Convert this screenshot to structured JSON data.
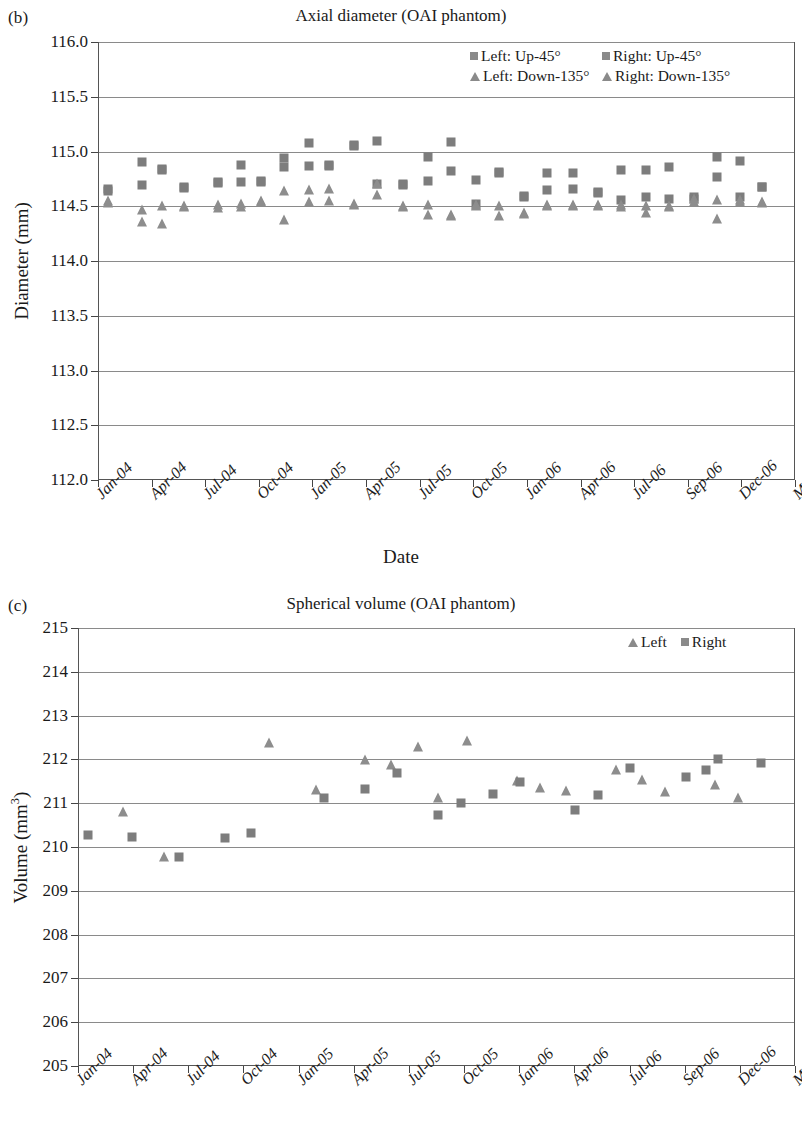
{
  "figure": {
    "panels": [
      {
        "id": "b",
        "panel_label": "(b)",
        "title": "Axial diameter (OAI phantom)"
      },
      {
        "id": "c",
        "panel_label": "(c)",
        "title": "Spherical volume (OAI phantom)"
      }
    ]
  },
  "chart_data": [
    {
      "type": "scatter",
      "panel": "(b)",
      "title": "Axial diameter (OAI phantom)",
      "xlabel": "Date",
      "ylabel": "Diameter (mm)",
      "ylim": [
        112.0,
        116.0
      ],
      "ytick_labels": [
        "116.0",
        "115.5",
        "115.0",
        "114.5",
        "114.0",
        "113.5",
        "113.0",
        "112.5",
        "112.0"
      ],
      "yticks": [
        116.0,
        115.5,
        115.0,
        114.5,
        114.0,
        113.5,
        113.0,
        112.5,
        112.0
      ],
      "xtick_labels": [
        "Jan-04",
        "Apr-04",
        "Jul-04",
        "Oct-04",
        "Jan-05",
        "Apr-05",
        "Jul-05",
        "Oct-05",
        "Jan-06",
        "Apr-06",
        "Jul-06",
        "Sep-06",
        "Dec-06",
        "Mar-07"
      ],
      "grid": true,
      "legend_position": "top-right",
      "legend": [
        "Left: Up-45°",
        "Right: Up-45°",
        "Left: Down-135°",
        "Right: Down-135°"
      ],
      "series": [
        {
          "name": "Left: Up-45°",
          "marker": "square",
          "color": "#7d7d7d",
          "points": [
            {
              "x": 0.35,
              "y": 114.66
            },
            {
              "x": 1.55,
              "y": 114.9
            },
            {
              "x": 2.25,
              "y": 114.84
            },
            {
              "x": 3.05,
              "y": 114.68
            },
            {
              "x": 4.25,
              "y": 114.72
            },
            {
              "x": 5.05,
              "y": 114.88
            },
            {
              "x": 5.75,
              "y": 114.73
            },
            {
              "x": 6.55,
              "y": 114.94
            },
            {
              "x": 7.45,
              "y": 115.08
            },
            {
              "x": 8.15,
              "y": 114.88
            },
            {
              "x": 9.05,
              "y": 115.06
            },
            {
              "x": 9.85,
              "y": 115.1
            },
            {
              "x": 10.75,
              "y": 114.7
            },
            {
              "x": 11.65,
              "y": 114.95
            },
            {
              "x": 12.45,
              "y": 115.09
            },
            {
              "x": 13.35,
              "y": 114.74
            },
            {
              "x": 14.15,
              "y": 114.81
            },
            {
              "x": 15.05,
              "y": 114.58
            },
            {
              "x": 15.85,
              "y": 114.8
            },
            {
              "x": 16.75,
              "y": 114.8
            },
            {
              "x": 17.65,
              "y": 114.63
            },
            {
              "x": 18.45,
              "y": 114.83
            },
            {
              "x": 19.35,
              "y": 114.83
            },
            {
              "x": 20.15,
              "y": 114.86
            },
            {
              "x": 21.05,
              "y": 114.57
            },
            {
              "x": 21.85,
              "y": 114.95
            },
            {
              "x": 22.65,
              "y": 114.91
            },
            {
              "x": 23.45,
              "y": 114.68
            }
          ]
        },
        {
          "name": "Right: Up-45°",
          "marker": "square",
          "color": "#7d7d7d",
          "points": [
            {
              "x": 0.35,
              "y": 114.64
            },
            {
              "x": 1.55,
              "y": 114.69
            },
            {
              "x": 2.25,
              "y": 114.83
            },
            {
              "x": 3.05,
              "y": 114.67
            },
            {
              "x": 4.25,
              "y": 114.71
            },
            {
              "x": 5.05,
              "y": 114.72
            },
            {
              "x": 5.75,
              "y": 114.72
            },
            {
              "x": 6.55,
              "y": 114.86
            },
            {
              "x": 7.45,
              "y": 114.87
            },
            {
              "x": 8.15,
              "y": 114.87
            },
            {
              "x": 9.05,
              "y": 115.05
            },
            {
              "x": 9.85,
              "y": 114.7
            },
            {
              "x": 10.75,
              "y": 114.69
            },
            {
              "x": 11.65,
              "y": 114.73
            },
            {
              "x": 12.45,
              "y": 114.82
            },
            {
              "x": 13.35,
              "y": 114.52
            },
            {
              "x": 14.15,
              "y": 114.8
            },
            {
              "x": 15.05,
              "y": 114.59
            },
            {
              "x": 15.85,
              "y": 114.65
            },
            {
              "x": 16.75,
              "y": 114.66
            },
            {
              "x": 17.65,
              "y": 114.62
            },
            {
              "x": 18.45,
              "y": 114.56
            },
            {
              "x": 19.35,
              "y": 114.58
            },
            {
              "x": 20.15,
              "y": 114.57
            },
            {
              "x": 21.05,
              "y": 114.58
            },
            {
              "x": 21.85,
              "y": 114.77
            },
            {
              "x": 22.65,
              "y": 114.58
            },
            {
              "x": 23.45,
              "y": 114.68
            }
          ]
        },
        {
          "name": "Left: Down-135°",
          "marker": "triangle",
          "color": "#8d8d8d",
          "points": [
            {
              "x": 0.35,
              "y": 114.55
            },
            {
              "x": 1.55,
              "y": 114.36
            },
            {
              "x": 2.25,
              "y": 114.34
            },
            {
              "x": 3.05,
              "y": 114.49
            },
            {
              "x": 4.25,
              "y": 114.51
            },
            {
              "x": 5.05,
              "y": 114.49
            },
            {
              "x": 5.75,
              "y": 114.55
            },
            {
              "x": 6.55,
              "y": 114.37
            },
            {
              "x": 7.45,
              "y": 114.65
            },
            {
              "x": 8.15,
              "y": 114.55
            },
            {
              "x": 9.05,
              "y": 114.52
            },
            {
              "x": 9.85,
              "y": 114.7
            },
            {
              "x": 10.75,
              "y": 114.5
            },
            {
              "x": 11.65,
              "y": 114.42
            },
            {
              "x": 12.45,
              "y": 114.42
            },
            {
              "x": 13.35,
              "y": 114.51
            },
            {
              "x": 14.15,
              "y": 114.41
            },
            {
              "x": 15.05,
              "y": 114.44
            },
            {
              "x": 15.85,
              "y": 114.51
            },
            {
              "x": 16.75,
              "y": 114.51
            },
            {
              "x": 17.65,
              "y": 114.51
            },
            {
              "x": 18.45,
              "y": 114.51
            },
            {
              "x": 19.35,
              "y": 114.44
            },
            {
              "x": 20.15,
              "y": 114.5
            },
            {
              "x": 21.05,
              "y": 114.57
            },
            {
              "x": 21.85,
              "y": 114.38
            },
            {
              "x": 22.65,
              "y": 114.56
            },
            {
              "x": 23.45,
              "y": 114.54
            }
          ]
        },
        {
          "name": "Right: Down-135°",
          "marker": "triangle",
          "color": "#8d8d8d",
          "points": [
            {
              "x": 0.35,
              "y": 114.53
            },
            {
              "x": 1.55,
              "y": 114.47
            },
            {
              "x": 2.25,
              "y": 114.5
            },
            {
              "x": 3.05,
              "y": 114.5
            },
            {
              "x": 4.25,
              "y": 114.48
            },
            {
              "x": 5.05,
              "y": 114.52
            },
            {
              "x": 5.75,
              "y": 114.54
            },
            {
              "x": 6.55,
              "y": 114.64
            },
            {
              "x": 7.45,
              "y": 114.54
            },
            {
              "x": 8.15,
              "y": 114.66
            },
            {
              "x": 9.05,
              "y": 114.51
            },
            {
              "x": 9.85,
              "y": 114.6
            },
            {
              "x": 10.75,
              "y": 114.49
            },
            {
              "x": 11.65,
              "y": 114.51
            },
            {
              "x": 12.45,
              "y": 114.41
            },
            {
              "x": 13.35,
              "y": 114.5
            },
            {
              "x": 14.15,
              "y": 114.5
            },
            {
              "x": 15.05,
              "y": 114.43
            },
            {
              "x": 15.85,
              "y": 114.5
            },
            {
              "x": 16.75,
              "y": 114.5
            },
            {
              "x": 17.65,
              "y": 114.5
            },
            {
              "x": 18.45,
              "y": 114.49
            },
            {
              "x": 19.35,
              "y": 114.5
            },
            {
              "x": 20.15,
              "y": 114.49
            },
            {
              "x": 21.05,
              "y": 114.54
            },
            {
              "x": 21.85,
              "y": 114.56
            },
            {
              "x": 22.65,
              "y": 114.54
            },
            {
              "x": 23.45,
              "y": 114.53
            }
          ]
        }
      ]
    },
    {
      "type": "scatter",
      "panel": "(c)",
      "title": "Spherical volume (OAI phantom)",
      "xlabel": "",
      "ylabel": "Volume (mm³)",
      "ylim": [
        205,
        215
      ],
      "ytick_labels": [
        "215",
        "214",
        "213",
        "212",
        "211",
        "210",
        "209",
        "208",
        "207",
        "206",
        "205"
      ],
      "yticks": [
        215,
        214,
        213,
        212,
        211,
        210,
        209,
        208,
        207,
        206,
        205
      ],
      "xtick_labels": [
        "Jan-04",
        "Apr-04",
        "Jul-04",
        "Oct-04",
        "Jan-05",
        "Apr-05",
        "Jul-05",
        "Oct-05",
        "Jan-06",
        "Apr-06",
        "Jul-06",
        "Sep-06",
        "Dec-06",
        "Mar-07"
      ],
      "grid": true,
      "legend_position": "top-right",
      "legend": [
        "Left",
        "Right"
      ],
      "series": [
        {
          "name": "Left",
          "marker": "triangle",
          "color": "#8d8d8d",
          "points": [
            {
              "x": 1.55,
              "y": 210.8
            },
            {
              "x": 2.95,
              "y": 209.78
            },
            {
              "x": 6.55,
              "y": 212.38
            },
            {
              "x": 8.15,
              "y": 211.3
            },
            {
              "x": 9.85,
              "y": 211.98
            },
            {
              "x": 10.75,
              "y": 211.88
            },
            {
              "x": 11.65,
              "y": 212.28
            },
            {
              "x": 12.35,
              "y": 211.13
            },
            {
              "x": 13.35,
              "y": 212.42
            },
            {
              "x": 15.05,
              "y": 211.5
            },
            {
              "x": 15.85,
              "y": 211.35
            },
            {
              "x": 16.75,
              "y": 211.28
            },
            {
              "x": 18.45,
              "y": 211.75
            },
            {
              "x": 19.35,
              "y": 211.52
            },
            {
              "x": 20.15,
              "y": 211.25
            },
            {
              "x": 21.85,
              "y": 211.42
            },
            {
              "x": 22.65,
              "y": 211.12
            }
          ]
        },
        {
          "name": "Right",
          "marker": "square",
          "color": "#7d7d7d",
          "points": [
            {
              "x": 0.35,
              "y": 210.28
            },
            {
              "x": 1.85,
              "y": 210.22
            },
            {
              "x": 3.45,
              "y": 209.78
            },
            {
              "x": 5.05,
              "y": 210.2
            },
            {
              "x": 5.95,
              "y": 210.32
            },
            {
              "x": 8.45,
              "y": 211.12
            },
            {
              "x": 9.85,
              "y": 211.32
            },
            {
              "x": 10.95,
              "y": 211.68
            },
            {
              "x": 12.35,
              "y": 210.72
            },
            {
              "x": 13.15,
              "y": 211.0
            },
            {
              "x": 14.25,
              "y": 211.22
            },
            {
              "x": 15.15,
              "y": 211.48
            },
            {
              "x": 17.05,
              "y": 210.85
            },
            {
              "x": 17.85,
              "y": 211.18
            },
            {
              "x": 18.95,
              "y": 211.8
            },
            {
              "x": 20.85,
              "y": 211.6
            },
            {
              "x": 21.55,
              "y": 211.75
            },
            {
              "x": 21.95,
              "y": 212.0
            },
            {
              "x": 23.45,
              "y": 211.92
            }
          ]
        }
      ]
    }
  ]
}
